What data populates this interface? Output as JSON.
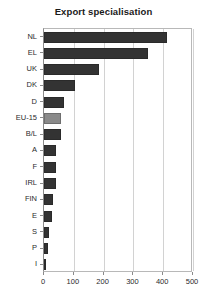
{
  "chart_data": {
    "type": "bar",
    "orientation": "horizontal",
    "title": "Export specialisation",
    "xlabel": "",
    "ylabel": "",
    "categories": [
      "NL",
      "EL",
      "UK",
      "DK",
      "D",
      "EU-15",
      "B/L",
      "A",
      "F",
      "IRL",
      "FIN",
      "E",
      "S",
      "P",
      "I"
    ],
    "values": [
      413,
      350,
      185,
      105,
      67,
      57,
      57,
      40,
      40,
      40,
      30,
      27,
      17,
      13,
      7
    ],
    "xlim": [
      0,
      500
    ],
    "xticks": [
      0,
      100,
      200,
      300,
      400,
      500
    ],
    "xtick_labels": [
      "0",
      "100",
      "200",
      "300",
      "400",
      "500"
    ],
    "grid": true,
    "grid_axis": "x",
    "legend": null,
    "highlight_category": "EU-15",
    "colors": {
      "bar": "#333333",
      "bar_highlight": "#8a8a8a",
      "gridline": "#d2d2d2",
      "axis": "#8a8a8a",
      "frame": "#b8b8b8",
      "text": "#2b2b2b",
      "title": "#1a1a1a",
      "background": "#ffffff"
    }
  }
}
